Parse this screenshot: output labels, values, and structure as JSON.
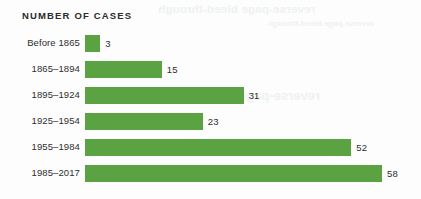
{
  "chart": {
    "title": "NUMBER OF CASES",
    "bar_color": "#5ba342",
    "label_color": "#2f2f2f",
    "background_color": "#fcfdfc"
  },
  "chart_data": {
    "type": "bar",
    "orientation": "horizontal",
    "title": "NUMBER OF CASES",
    "xlabel": "",
    "ylabel": "",
    "xlim": [
      0,
      58
    ],
    "grid": false,
    "legend": null,
    "categories": [
      "Before 1865",
      "1865–1894",
      "1895–1924",
      "1925–1954",
      "1955–1984",
      "1985–2017"
    ],
    "values": [
      3,
      15,
      31,
      23,
      52,
      58
    ],
    "value_labels": [
      "3",
      "15",
      "31",
      "23",
      "52",
      "58"
    ],
    "max_value": 58
  },
  "ghost_text": {
    "line1": "reverse-page bleed-through",
    "line2": "reverse-page bleed-through",
    "line3": "reverse-page bleed-through"
  }
}
